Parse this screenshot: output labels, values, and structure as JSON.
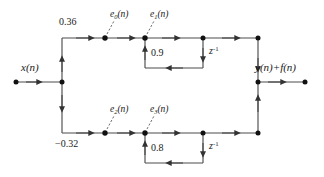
{
  "diagram": {
    "type": "signal-flow-graph",
    "title": "",
    "colors": {
      "line": "#4d4d4d",
      "node": "#111111",
      "text": "#1a1a1a",
      "background": "#ffffff"
    },
    "input": {
      "label_base": "x",
      "label_arg": "(n)",
      "label_full": "x(n)"
    },
    "output": {
      "label_full": "y(n)+f(n)",
      "parts": {
        "y": "y",
        "y_arg": "(n)",
        "plus": "+",
        "f": "f",
        "f_arg": "(n)"
      }
    },
    "branches": [
      {
        "id": "upper",
        "gain_label": "0.36",
        "gain_value": 0.36,
        "feedback_label": "0.9",
        "feedback_value": 0.9,
        "delay_base": "z",
        "delay_exp": "-1",
        "delay_label": "z-1",
        "nodes": [
          {
            "id": "e0",
            "base": "e",
            "sub": "0",
            "arg": "(n)",
            "label_full": "e0(n)"
          },
          {
            "id": "e1",
            "base": "e",
            "sub": "1",
            "arg": "(n)",
            "label_full": "e1(n)"
          }
        ]
      },
      {
        "id": "lower",
        "gain_label": "−0.32",
        "gain_value": -0.32,
        "feedback_label": "0.8",
        "feedback_value": 0.8,
        "delay_base": "z",
        "delay_exp": "-1",
        "delay_label": "z-1",
        "nodes": [
          {
            "id": "e2",
            "base": "e",
            "sub": "2",
            "arg": "(n)",
            "label_full": "e2(n)"
          },
          {
            "id": "e3",
            "base": "e",
            "sub": "3",
            "arg": "(n)",
            "label_full": "e3(n)"
          }
        ]
      }
    ]
  }
}
